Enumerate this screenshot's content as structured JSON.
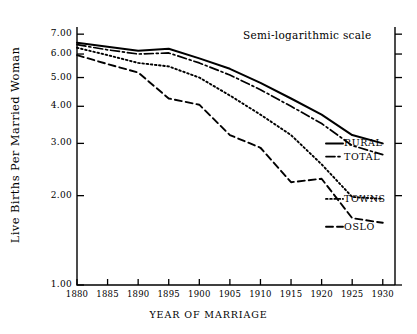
{
  "chart_data": {
    "type": "line",
    "title": "",
    "annotation": "Semi-logarithmic scale",
    "xlabel": "YEAR OF MARRIAGE",
    "ylabel": "Live Births Per Married Woman",
    "yscale": "log",
    "ylim": [
      1.0,
      7.4
    ],
    "xlim": [
      1880,
      1932
    ],
    "grid": false,
    "legend_position": "right-inline",
    "yticks": [
      7.0,
      6.0,
      5.0,
      4.0,
      3.0,
      2.0,
      1.0
    ],
    "ytick_labels": [
      "7.00",
      "6.00",
      "5.00",
      "4.00",
      "3.00",
      "2.00",
      "1.00"
    ],
    "xticks": [
      1880,
      1885,
      1890,
      1895,
      1900,
      1905,
      1910,
      1915,
      1920,
      1925,
      1930
    ],
    "xtick_labels": [
      "1880",
      "1885",
      "1890",
      "1895",
      "1900",
      "1905",
      "1910",
      "1915",
      "1920",
      "1925",
      "1930"
    ],
    "x": [
      1880,
      1885,
      1890,
      1895,
      1900,
      1905,
      1910,
      1915,
      1920,
      1925,
      1930
    ],
    "series": [
      {
        "name": "RURAL",
        "label": "RURAL",
        "style": "solid",
        "color": "#000000",
        "values": [
          6.55,
          6.35,
          6.15,
          6.25,
          5.8,
          5.35,
          4.8,
          4.25,
          3.75,
          3.2,
          3.0
        ]
      },
      {
        "name": "TOTAL",
        "label": "TOTAL",
        "style": "dashdot",
        "color": "#000000",
        "values": [
          6.45,
          6.2,
          6.0,
          6.05,
          5.6,
          5.1,
          4.55,
          4.0,
          3.5,
          2.95,
          2.75
        ]
      },
      {
        "name": "TOWNS",
        "label": "TOWNS",
        "style": "dotted",
        "color": "#000000",
        "values": [
          6.3,
          5.95,
          5.6,
          5.45,
          5.0,
          4.35,
          3.75,
          3.2,
          2.55,
          1.98,
          1.95
        ]
      },
      {
        "name": "OSLO",
        "label": "OSLO",
        "style": "dashed",
        "color": "#000000",
        "values": [
          5.95,
          5.55,
          5.2,
          4.25,
          4.05,
          3.2,
          2.9,
          2.22,
          2.28,
          1.68,
          1.62
        ]
      }
    ]
  },
  "axes": {
    "frame_color": "#000000"
  }
}
